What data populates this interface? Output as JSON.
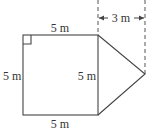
{
  "diagram": {
    "type": "composite-shape",
    "square": {
      "top_label": "5 m",
      "left_label": "5 m",
      "right_label": "5 m",
      "bottom_label": "5 m",
      "right_angle_marker": true
    },
    "triangle": {
      "height_label": "3 m"
    },
    "colors": {
      "line": "#444444",
      "text": "#333333",
      "background": "#ffffff"
    }
  }
}
